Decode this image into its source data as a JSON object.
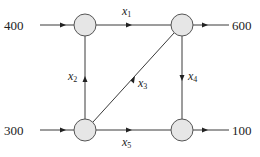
{
  "diagram": {
    "type": "network-flow",
    "nodes": [
      {
        "id": "A",
        "name": "top-left"
      },
      {
        "id": "B",
        "name": "top-right"
      },
      {
        "id": "C",
        "name": "bottom-left"
      },
      {
        "id": "D",
        "name": "bottom-right"
      }
    ],
    "external_flows": [
      {
        "node": "A",
        "direction": "in",
        "value": "400"
      },
      {
        "node": "B",
        "direction": "out",
        "value": "600"
      },
      {
        "node": "C",
        "direction": "in",
        "value": "300"
      },
      {
        "node": "D",
        "direction": "out",
        "value": "100"
      }
    ],
    "edges": [
      {
        "from": "A",
        "to": "B",
        "var": "x",
        "sub": "1"
      },
      {
        "from": "C",
        "to": "A",
        "var": "x",
        "sub": "2"
      },
      {
        "from": "C",
        "to": "B",
        "var": "x",
        "sub": "3"
      },
      {
        "from": "B",
        "to": "D",
        "var": "x",
        "sub": "4"
      },
      {
        "from": "C",
        "to": "D",
        "var": "x",
        "sub": "5"
      }
    ]
  }
}
